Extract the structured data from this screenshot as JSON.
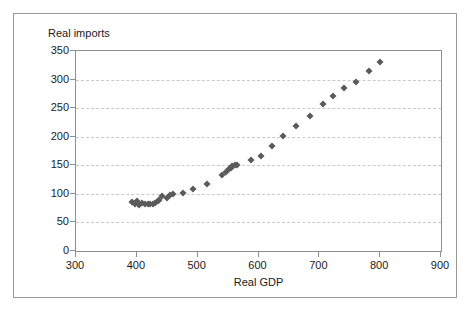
{
  "chart_data": {
    "type": "scatter",
    "title": "",
    "xlabel": "Real GDP",
    "ylabel": "Real imports",
    "xlim": [
      300,
      900
    ],
    "ylim": [
      0,
      350
    ],
    "xticks": [
      300,
      400,
      500,
      600,
      700,
      800,
      900
    ],
    "yticks": [
      0,
      50,
      100,
      150,
      200,
      250,
      300,
      350
    ],
    "xtick_labels": [
      "300",
      "400",
      "500",
      "600",
      "700",
      "800",
      "900"
    ],
    "ytick_labels": [
      "0",
      "50",
      "100",
      "150",
      "200",
      "250",
      "300",
      "350"
    ],
    "grid": "horizontal-dashed",
    "legend": "none",
    "marker": "diamond",
    "marker_color": "#5a5a5a",
    "series": [
      {
        "name": "Real imports vs Real GDP",
        "points": [
          [
            392,
            86
          ],
          [
            397,
            83
          ],
          [
            401,
            88
          ],
          [
            404,
            80
          ],
          [
            409,
            84
          ],
          [
            414,
            83
          ],
          [
            418,
            82
          ],
          [
            422,
            83
          ],
          [
            426,
            82
          ],
          [
            430,
            84
          ],
          [
            434,
            87
          ],
          [
            437,
            90
          ],
          [
            441,
            96
          ],
          [
            449,
            92
          ],
          [
            455,
            98
          ],
          [
            460,
            100
          ],
          [
            476,
            101
          ],
          [
            493,
            109
          ],
          [
            515,
            118
          ],
          [
            540,
            133
          ],
          [
            547,
            139
          ],
          [
            551,
            144
          ],
          [
            554,
            146
          ],
          [
            557,
            148
          ],
          [
            561,
            150
          ],
          [
            565,
            151
          ],
          [
            587,
            159
          ],
          [
            604,
            167
          ],
          [
            622,
            184
          ],
          [
            641,
            201
          ],
          [
            662,
            219
          ],
          [
            684,
            237
          ],
          [
            706,
            257
          ],
          [
            723,
            272
          ],
          [
            740,
            286
          ],
          [
            761,
            295
          ],
          [
            782,
            315
          ],
          [
            800,
            331
          ]
        ]
      }
    ]
  },
  "axes": {
    "ylabel_text": "Real imports",
    "xlabel_text": "Real GDP"
  }
}
